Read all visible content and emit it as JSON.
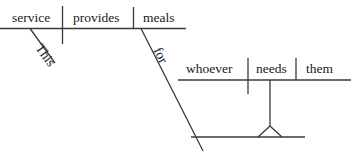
{
  "diagram": {
    "kind": "reed-kellogg-sentence-diagram",
    "sentence": "This service provides meals for whoever needs them.",
    "line_color": "#3a3a3a",
    "text_color": "#1a1a1a",
    "background_color": "#ffffff",
    "main_clause": {
      "subject": "service",
      "verb": "provides",
      "direct_object": "meals",
      "subject_modifier": "This"
    },
    "prepositional_phrase": {
      "preposition": "for"
    },
    "object_clause": {
      "subject": "whoever",
      "verb": "needs",
      "direct_object": "them"
    },
    "placeholder": {
      "name": "triangle-support",
      "label": ""
    }
  }
}
